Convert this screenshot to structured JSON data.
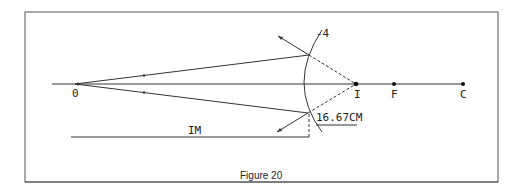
{
  "figure": {
    "caption": "Figure 20",
    "labels": {
      "object": "0",
      "image": "I",
      "focus": "F",
      "center": "C",
      "mirror_power": "-4",
      "image_distance": "16.67CM",
      "image_distance_line": "IM"
    },
    "colors": {
      "line": "#333333",
      "frame": "#555555",
      "background": "#ffffff"
    }
  }
}
